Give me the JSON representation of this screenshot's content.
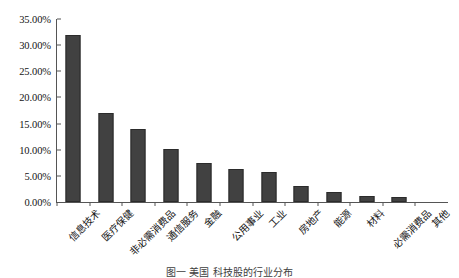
{
  "chart_data": {
    "type": "bar",
    "title": "",
    "xlabel": "",
    "ylabel": "",
    "ylim": [
      0,
      35
    ],
    "ytick_values": [
      0,
      5,
      10,
      15,
      20,
      25,
      30,
      35
    ],
    "ytick_labels": [
      "0.00%",
      "5.00%",
      "10.00%",
      "15.00%",
      "20.00%",
      "25.00%",
      "30.00%",
      "35.00%"
    ],
    "grid": false,
    "legend": null,
    "bar_color": "#414141",
    "axis_color": "#555555",
    "categories": [
      "信息技术",
      "医疗保健",
      "非必需消费品",
      "通信服务",
      "金融",
      "公用事业",
      "工业",
      "房地产",
      "能源",
      "材料",
      "必需消费品",
      "其他"
    ],
    "values": [
      31.9,
      17.1,
      13.9,
      10.2,
      7.5,
      6.3,
      5.8,
      3.0,
      2.0,
      1.2,
      1.0,
      0.0
    ]
  },
  "caption": {
    "text": "图一 美国 科技股的行业分布"
  }
}
